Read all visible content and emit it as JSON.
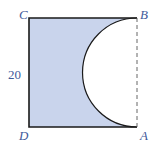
{
  "figure": {
    "labels": {
      "top_left": "C",
      "top_right": "B",
      "bottom_left": "D",
      "bottom_right": "A"
    },
    "side_length_label": "20",
    "colors": {
      "shaded_fill": "#c9d4ec",
      "outline": "#1a1a1a",
      "label": "#3f5a9a",
      "dashed_edge": "#555555"
    }
  }
}
